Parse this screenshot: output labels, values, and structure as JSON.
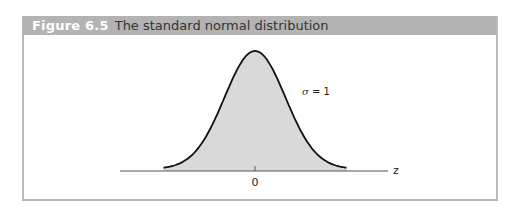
{
  "figure": {
    "label": "Figure 6.5",
    "title": "The standard normal distribution"
  },
  "colors": {
    "header_bg": "#b3b3b3",
    "frame_border": "#b9b9b9",
    "curve_fill": "#d9d9d9",
    "curve_stroke": "#111111",
    "axis": "#555555"
  },
  "chart_data": {
    "type": "area",
    "title": "The standard normal distribution",
    "xlabel": "z",
    "ylabel": "",
    "tick_labels": [
      "0"
    ],
    "x_ticks": [
      0
    ],
    "annotations": [
      {
        "text": "σ = 1",
        "position": "right of peak, upper slope"
      }
    ],
    "mean": 0,
    "sd": 1,
    "x_range": [
      -3,
      3
    ],
    "x": [
      -3,
      -2.5,
      -2,
      -1.5,
      -1,
      -0.5,
      0,
      0.5,
      1,
      1.5,
      2,
      2.5,
      3
    ],
    "values": [
      0.0044,
      0.0175,
      0.054,
      0.1295,
      0.242,
      0.3521,
      0.3989,
      0.3521,
      0.242,
      0.1295,
      0.054,
      0.0175,
      0.0044
    ],
    "grid": false,
    "legend": null
  },
  "annotation": {
    "sigma_symbol": "σ",
    "sigma_eq": " = 1"
  },
  "axis": {
    "x_label": "z",
    "tick_zero": "0"
  }
}
